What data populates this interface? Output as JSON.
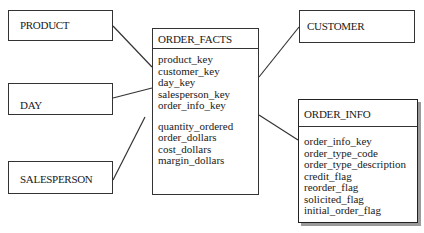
{
  "diagram": {
    "type": "star-schema",
    "fact_table": {
      "name": "ORDER_FACTS",
      "keys": [
        "product_key",
        "customer_key",
        "day_key",
        "salesperson_key",
        "order_info_key"
      ],
      "measures": [
        "quantity_ordered",
        "order_dollars",
        "cost_dollars",
        "margin_dollars"
      ]
    },
    "dimensions": {
      "product": {
        "name": "PRODUCT"
      },
      "day": {
        "name": "DAY"
      },
      "salesperson": {
        "name": "SALESPERSON"
      },
      "customer": {
        "name": "CUSTOMER"
      },
      "order_info": {
        "name": "ORDER_INFO",
        "attributes": [
          "order_info_key",
          "order_type_code",
          "order_type_description",
          "credit_flag",
          "reorder_flag",
          "solicited_flag",
          "initial_order_flag"
        ]
      }
    },
    "relationships": [
      {
        "from": "PRODUCT",
        "to": "ORDER_FACTS"
      },
      {
        "from": "DAY",
        "to": "ORDER_FACTS"
      },
      {
        "from": "SALESPERSON",
        "to": "ORDER_FACTS"
      },
      {
        "from": "CUSTOMER",
        "to": "ORDER_FACTS"
      },
      {
        "from": "ORDER_INFO",
        "to": "ORDER_FACTS"
      }
    ],
    "colors": {
      "line": "#333333",
      "background": "#ffffff",
      "shadow": "#9a9a9a"
    }
  }
}
